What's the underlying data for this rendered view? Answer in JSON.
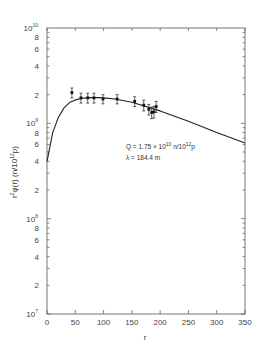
{
  "chart_data": {
    "type": "scatter",
    "title": "",
    "xlabel": "r",
    "ylabel": "r²φ(r) (n/10¹²p)",
    "xlim": [
      0,
      350
    ],
    "ylim": [
      10000000.0,
      10000000000.0
    ],
    "yscale": "log",
    "grid": false,
    "legend": null,
    "x_ticks": [
      0,
      50,
      100,
      150,
      200,
      250,
      300,
      350
    ],
    "y_major_ticks": [
      {
        "value": 10000000.0,
        "label": "10",
        "exp": "7"
      },
      {
        "value": 100000000.0,
        "label": "10",
        "exp": "8"
      },
      {
        "value": 1000000000.0,
        "label": "10",
        "exp": "9"
      },
      {
        "value": 10000000000.0,
        "label": "10",
        "exp": "10"
      }
    ],
    "y_minor_labels": [
      "2",
      "4",
      "6",
      "8"
    ],
    "annotations": [
      {
        "text": "Q = 1.75 × 10¹⁰ n/10¹²p",
        "parts": {
          "pre": "Q = 1.75 × 10",
          "exp1": "10",
          "mid": " n/10",
          "exp2": "12",
          "post": "p"
        }
      },
      {
        "text": "λ = 184.4 m"
      }
    ],
    "series": [
      {
        "name": "measured",
        "type": "scatter_errorbar",
        "x": [
          44,
          60,
          72,
          83,
          99,
          124,
          155,
          171,
          180,
          185,
          189,
          193
        ],
        "y": [
          2100000000.0,
          1850000000.0,
          1850000000.0,
          1850000000.0,
          1800000000.0,
          1800000000.0,
          1700000000.0,
          1550000000.0,
          1400000000.0,
          1300000000.0,
          1320000000.0,
          1500000000.0
        ],
        "err": [
          250000000.0,
          220000000.0,
          220000000.0,
          220000000.0,
          200000000.0,
          200000000.0,
          200000000.0,
          200000000.0,
          180000000.0,
          180000000.0,
          180000000.0,
          200000000.0
        ]
      },
      {
        "name": "fit",
        "type": "line",
        "x": [
          0,
          10,
          20,
          30,
          40,
          50,
          60,
          70,
          80,
          90,
          100,
          120,
          150,
          200,
          250,
          300,
          350
        ],
        "y": [
          400000000.0,
          800000000.0,
          1150000000.0,
          1450000000.0,
          1650000000.0,
          1760000000.0,
          1820000000.0,
          1850000000.0,
          1860000000.0,
          1860000000.0,
          1850000000.0,
          1800000000.0,
          1660000000.0,
          1350000000.0,
          1050000000.0,
          800000000.0,
          620000000.0
        ]
      }
    ]
  },
  "labels": {
    "xlabel": "r",
    "ylabel_main": "r",
    "ylabel_sup": "2",
    "ylabel_rest": "φ(r) (n/10",
    "ylabel_sup2": "12",
    "ylabel_end": "p)",
    "annot_line1_pre": "Q = 1.75 × 10",
    "annot_line1_exp1": "10",
    "annot_line1_mid": " n/10",
    "annot_line1_exp2": "12",
    "annot_line1_post": "p",
    "annot_line2": "λ = 184.4 m"
  }
}
